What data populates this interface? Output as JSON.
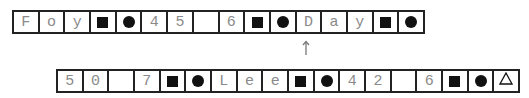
{
  "top_row": {
    "cells": [
      {
        "type": "char",
        "value": "F"
      },
      {
        "type": "char",
        "value": "o"
      },
      {
        "type": "char",
        "value": "y"
      },
      {
        "type": "icon",
        "value": "square"
      },
      {
        "type": "icon",
        "value": "circle"
      },
      {
        "type": "char",
        "value": "4"
      },
      {
        "type": "char",
        "value": "5"
      },
      {
        "type": "char",
        "value": ""
      },
      {
        "type": "char",
        "value": "6"
      },
      {
        "type": "icon",
        "value": "square"
      },
      {
        "type": "icon",
        "value": "circle"
      },
      {
        "type": "char",
        "value": "D"
      },
      {
        "type": "char",
        "value": "a"
      },
      {
        "type": "char",
        "value": "y"
      },
      {
        "type": "icon",
        "value": "square"
      },
      {
        "type": "icon",
        "value": "circle"
      }
    ]
  },
  "arrow": {
    "direction": "up",
    "glyph": "↑"
  },
  "bottom_row": {
    "cells": [
      {
        "type": "char",
        "value": "5"
      },
      {
        "type": "char",
        "value": "0"
      },
      {
        "type": "char",
        "value": ""
      },
      {
        "type": "char",
        "value": "7"
      },
      {
        "type": "icon",
        "value": "square"
      },
      {
        "type": "icon",
        "value": "circle"
      },
      {
        "type": "char",
        "value": "L"
      },
      {
        "type": "char",
        "value": "e"
      },
      {
        "type": "char",
        "value": "e"
      },
      {
        "type": "icon",
        "value": "square"
      },
      {
        "type": "icon",
        "value": "circle"
      },
      {
        "type": "char",
        "value": "4"
      },
      {
        "type": "char",
        "value": "2"
      },
      {
        "type": "char",
        "value": ""
      },
      {
        "type": "char",
        "value": "6"
      },
      {
        "type": "icon",
        "value": "square"
      },
      {
        "type": "icon",
        "value": "circle"
      },
      {
        "type": "icon",
        "value": "triangle"
      }
    ]
  },
  "colors": {
    "border": "#222222",
    "text": "#8a8a8a",
    "icon": "#111111"
  }
}
